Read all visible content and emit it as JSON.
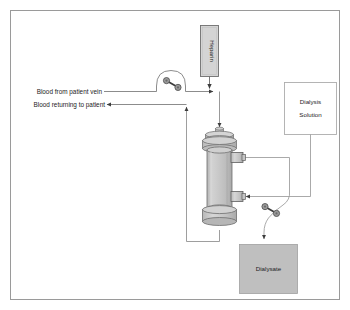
{
  "figure": {
    "type": "schematic-diagram",
    "frame_color": "#9a9a9a",
    "background_color": "#ffffff",
    "line_color": "#8d8d8d",
    "dark_line_color": "#3c3c3c",
    "cylinder_fill": "#c7c7c7",
    "cylinder_edge": "#6e6e6e",
    "box_gray_fill": "#bfbfbf",
    "box_light_fill": "#d4d4d4",
    "box_white_fill": "#ffffff",
    "pump_circle_fill": "#9b9b9b"
  },
  "labels": {
    "blood_in": "Blood from patient vein",
    "blood_out": "Blood returning to patient",
    "heparin": "Heparin",
    "dialysis_solution_line1": "Dialysis",
    "dialysis_solution_line2": "Solution",
    "dialysate": "Dialysate"
  },
  "components": [
    {
      "name": "heparin-box",
      "label": "Heparin",
      "orientation": "vertical-text",
      "fill": "#d4d4d4"
    },
    {
      "name": "blood-pump",
      "label": "",
      "type": "roller-pump"
    },
    {
      "name": "dialyzer",
      "label": "",
      "type": "cylinder-cartridge"
    },
    {
      "name": "dialysis-solution-box",
      "label": "Dialysis Solution",
      "fill": "#ffffff"
    },
    {
      "name": "dialysate-pump",
      "label": "",
      "type": "roller-pump"
    },
    {
      "name": "dialysate-box",
      "label": "Dialysate",
      "fill": "#bfbfbf"
    }
  ],
  "flows": [
    {
      "name": "blood-inflow",
      "from": "patient vein",
      "to": "dialyzer top",
      "direction": "down"
    },
    {
      "name": "heparin-injection",
      "from": "Heparin",
      "to": "blood line",
      "direction": "down"
    },
    {
      "name": "blood-return",
      "from": "dialyzer bottom",
      "to": "patient",
      "direction": "left"
    },
    {
      "name": "dialysate-supply",
      "from": "Dialysis Solution",
      "to": "dialyzer lower port",
      "direction": "left"
    },
    {
      "name": "dialysate-waste",
      "from": "dialyzer upper port",
      "to": "Dialysate",
      "direction": "down"
    }
  ]
}
